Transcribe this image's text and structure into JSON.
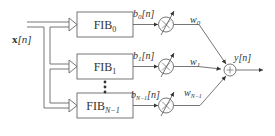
{
  "diagram": {
    "input_label": {
      "main": "x",
      "arg": "[n]"
    },
    "output_label": {
      "main": "y",
      "arg": "[n]"
    },
    "filters": [
      {
        "name": "FIB",
        "sub": "0"
      },
      {
        "name": "FIB",
        "sub": "1"
      },
      {
        "name": "FIB",
        "sub": "N−1"
      }
    ],
    "signals": [
      {
        "name": "b",
        "sub": "0",
        "arg": "[n]"
      },
      {
        "name": "b",
        "sub": "1",
        "arg": "[n]"
      },
      {
        "name": "b",
        "sub": "N−1",
        "arg": "[n]"
      }
    ],
    "weights": [
      {
        "name": "w",
        "sub": "0"
      },
      {
        "name": "w",
        "sub": "1"
      },
      {
        "name": "w",
        "sub": "N−1"
      }
    ],
    "multiplier_symbol": "×",
    "adder_symbol": "+",
    "ellipsis": "⋮",
    "colors": {
      "stroke": "#666666",
      "text": "#333333",
      "background": "#ffffff"
    }
  }
}
